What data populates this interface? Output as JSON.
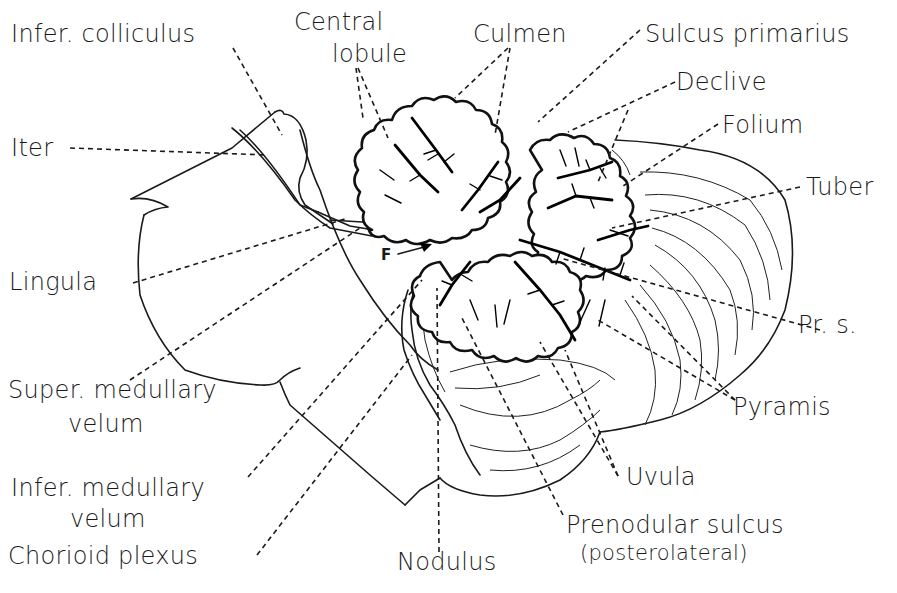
{
  "figure": {
    "labels": {
      "infer_colliculus": "Infer. colliculus",
      "central_lobule_line1": "Central",
      "central_lobule_line2": "lobule",
      "culmen": "Culmen",
      "sulcus_primarius": "Sulcus primarius",
      "declive": "Declive",
      "folium": "Folium",
      "tuber": "Tuber",
      "iter": "Iter",
      "lingula": "Lingula",
      "f_marker": "F",
      "pr_s": "Pr. s.",
      "super_medullary_velum_line1": "Super. medullary",
      "super_medullary_velum_line2": "velum",
      "pyramis": "Pyramis",
      "uvula": "Uvula",
      "infer_medullary_velum_line1": "Infer. medullary",
      "infer_medullary_velum_line2": "velum",
      "prenodular_sulcus_line1": "Prenodular sulcus",
      "prenodular_sulcus_line2": "(posterolateral)",
      "chorioid_plexus": "Chorioid plexus",
      "nodulus": "Nodulus"
    }
  }
}
